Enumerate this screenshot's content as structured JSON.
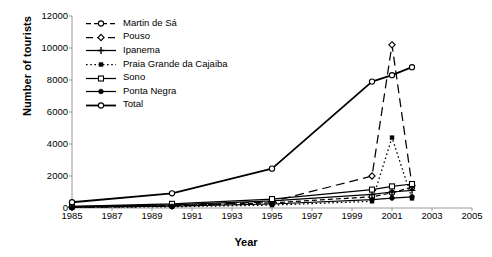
{
  "chart_data": {
    "type": "line",
    "title": "",
    "xlabel": "Year",
    "ylabel": "Number of tourists",
    "xlim": [
      1985,
      2005
    ],
    "ylim": [
      0,
      12000
    ],
    "xticks": [
      1985,
      1987,
      1989,
      1991,
      1993,
      1995,
      1997,
      1999,
      2001,
      2003,
      2005
    ],
    "yticks": [
      0,
      2000,
      4000,
      6000,
      8000,
      10000,
      12000
    ],
    "grid": false,
    "legend_position": "top-left",
    "x": [
      1985,
      1990,
      1995,
      2000,
      2001,
      2002
    ],
    "series": [
      {
        "name": "Martin de Sá",
        "values": [
          60,
          150,
          320,
          700,
          950,
          1300
        ],
        "style": "dashed",
        "marker": "open-circle",
        "key_icon": "dashed-open-circle-icon"
      },
      {
        "name": "Pouso",
        "values": [
          40,
          120,
          400,
          2000,
          10200,
          1400
        ],
        "style": "long-dash",
        "marker": "open-diamond",
        "key_icon": "line-open-diamond-icon"
      },
      {
        "name": "Ipanema",
        "values": [
          80,
          200,
          450,
          850,
          1000,
          1100
        ],
        "style": "solid",
        "marker": "plus",
        "key_icon": "line-plus-icon"
      },
      {
        "name": "Praia Grande da Cajaiba",
        "values": [
          30,
          80,
          180,
          420,
          4400,
          600
        ],
        "style": "dotted",
        "marker": "filled-square",
        "key_icon": "dotted-filled-square-icon"
      },
      {
        "name": "Sono",
        "values": [
          100,
          260,
          560,
          1150,
          1350,
          1500
        ],
        "style": "solid",
        "marker": "open-square",
        "key_icon": "line-open-square-icon"
      },
      {
        "name": "Ponta Negra",
        "values": [
          50,
          110,
          250,
          520,
          620,
          700
        ],
        "style": "solid",
        "marker": "filled-circle",
        "key_icon": "line-filled-circle-icon"
      },
      {
        "name": "Total",
        "values": [
          360,
          920,
          2460,
          7900,
          8300,
          8800
        ],
        "style": "solid-bold",
        "marker": "open-circle",
        "key_icon": "line-open-circle-icon"
      }
    ]
  }
}
